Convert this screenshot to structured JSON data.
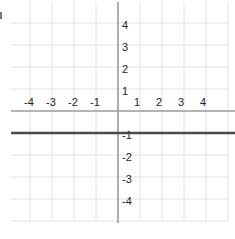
{
  "chart_data": {
    "type": "line",
    "title": "",
    "xlabel": "",
    "ylabel": "",
    "xlim": [
      -5,
      5
    ],
    "ylim": [
      -5,
      5
    ],
    "grid": true,
    "x_tick_labels": [
      "-4",
      "-3",
      "-2",
      "-1",
      "1",
      "2",
      "3",
      "4"
    ],
    "y_tick_labels": [
      "4",
      "3",
      "2",
      "1",
      "-1",
      "-2",
      "-3",
      "-4"
    ],
    "series": [
      {
        "name": "y = -1",
        "equation": "y = -1",
        "x": [
          -5,
          5
        ],
        "y": [
          -1,
          -1
        ]
      }
    ]
  },
  "colors": {
    "grid": "#e2e2e2",
    "axis": "#9a9a9a",
    "line": "#4a4a4a",
    "text": "#222222"
  }
}
